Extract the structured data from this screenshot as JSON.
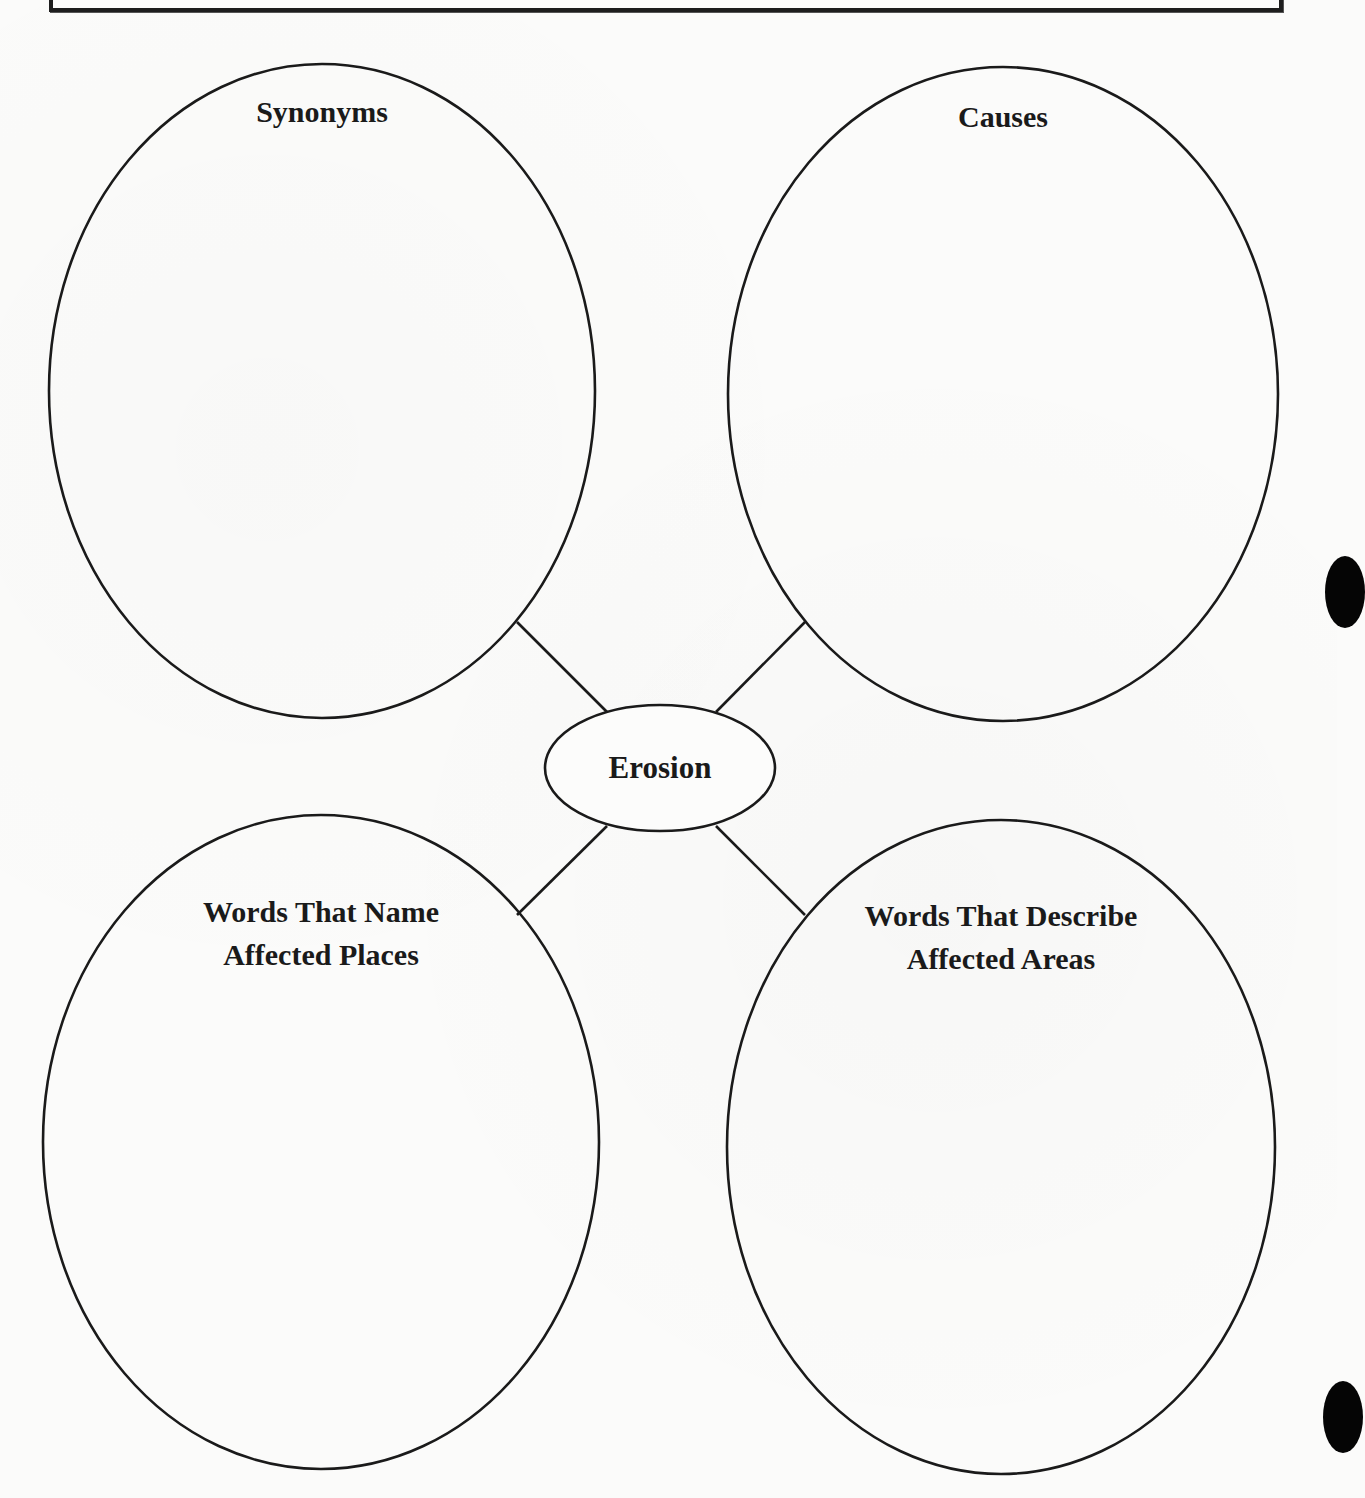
{
  "document": {
    "type": "word web graphic organizer",
    "center_topic": "Erosion",
    "bubbles": [
      {
        "position": "top-left",
        "lines": [
          "Synonyms"
        ]
      },
      {
        "position": "top-right",
        "lines": [
          "Causes"
        ]
      },
      {
        "position": "bottom-left",
        "lines": [
          "Words That Name",
          "Affected Places"
        ]
      },
      {
        "position": "bottom-right",
        "lines": [
          "Words That Describe",
          "Affected Areas"
        ]
      }
    ]
  },
  "colors": {
    "ink": "#1a1a1a",
    "paper": "#fbfbfa"
  }
}
